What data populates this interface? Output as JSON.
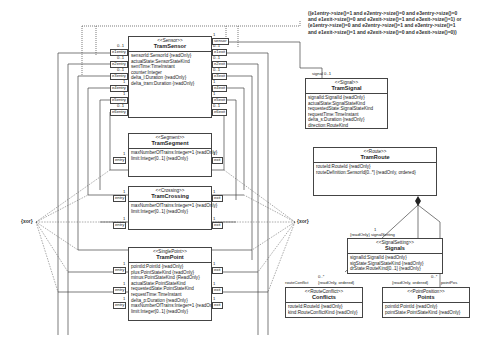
{
  "constraint": {
    "lines": [
      "((e1entry->size()=1 and e2entry->size()=0 and e3entry->size()=0",
      "and e1exit->size()=0 and e2exit->size()=1 and e3exit->size()=1) or",
      "(e1entry->size()=0 and e2entry->size()=1 and e3entry->size()=1",
      "and e1exit->size()=1 and e2exit->size()=0 and e3exit->size()=0))"
    ]
  },
  "xor": {
    "left": "{xor}",
    "right": "{xor}"
  },
  "classes": {
    "tram_sensor": {
      "stereotype": "<<Sensor>>",
      "name": "TramSensor",
      "attributes": [
        "sensorId:SensorId {readOnly}",
        "actualState:SensorStateKind",
        "sentTime:TimeInstant",
        "counter:Integer",
        "delta_l:Duration {readOnly}",
        "delta_tram:Duration {readOnly}"
      ],
      "left_ports": [
        {
          "mult": "0..1",
          "role": "e1entry"
        },
        {
          "mult": "0..1",
          "role": "e2entry"
        },
        {
          "mult": "0..1",
          "role": "e3entry"
        },
        {
          "mult": "1",
          "role": "e4entry"
        },
        {
          "mult": "1",
          "role": "e5entry"
        },
        {
          "mult": "0..1",
          "role": "e6entry"
        }
      ],
      "right_ports": [
        {
          "mult": "1",
          "role": "sensor"
        },
        {
          "mult": "0..1",
          "role": "e1exit"
        },
        {
          "mult": "0..1",
          "role": "e2exit"
        },
        {
          "mult": "0..1",
          "role": "e3exit"
        },
        {
          "mult": "1",
          "role": "e4exit"
        },
        {
          "mult": "1",
          "role": "e5exit"
        },
        {
          "mult": "0..1",
          "role": "e6exit"
        }
      ]
    },
    "tram_signal": {
      "role_label": "signal 0..1",
      "stereotype": "<<Signal>>",
      "name": "TramSignal",
      "attributes": [
        "signalId:SignalId {readOnly}",
        "actualState:SignalStateKind",
        "requestedState:SignalStateKind",
        "requestTime:TimeInstant",
        "delta_s:Duration {readOnly}",
        "direction:RouteKind"
      ]
    },
    "tram_segment": {
      "stereotype": "<<Segment>>",
      "name": "TramSegment",
      "attributes": [
        "maxNumberOfTrains:Integer=1 {readOnly}",
        "limit:Integer[0..1] {readOnly}"
      ],
      "entry": {
        "mult": "1",
        "role": "entry"
      },
      "exit": {
        "mult": "1",
        "role": "exit"
      }
    },
    "tram_crossing": {
      "stereotype": "<<Crossing>>",
      "name": "TramCrossing",
      "attributes": [
        "maxNumberOfTrains:Integer=1 {readOnly}",
        "limit:Integer[0..1] {readOnly}"
      ],
      "entries": [
        {
          "mult": "1",
          "role": "entry"
        },
        {
          "mult": "1",
          "role": "entry"
        }
      ],
      "exits": [
        {
          "mult": "1",
          "role": "exit"
        },
        {
          "mult": "1",
          "role": "exit"
        }
      ]
    },
    "tram_point": {
      "stereotype": "<<SinglePoint>>",
      "name": "TramPoint",
      "attributes": [
        "pointId:PointId {readOnly}",
        "plus:PointStateKind {readOnly}",
        "minus:PointStateKind {ReadOnly}",
        "actualState:PointStateKind",
        "requestedState:PointStateKind",
        "requestTime:TimeInstant",
        "delta_p:Duration {readOnly}",
        "maxNumberOfTrains:Integer=1 {readOnly}",
        "limit:Integer[0..1] {readOnly}"
      ],
      "entries": [
        {
          "mult": "1",
          "role": "entry"
        },
        {
          "mult": "1",
          "role": "entry"
        },
        {
          "mult": "1",
          "role": "entry"
        }
      ],
      "exits": [
        {
          "mult": "1",
          "role": "exit"
        },
        {
          "mult": "1",
          "role": "exit"
        },
        {
          "mult": "1",
          "role": "exit"
        }
      ]
    },
    "tram_route": {
      "stereotype": "<<Route>>",
      "name": "TramRoute",
      "attributes": [
        "routeId:RouteId {readOnly}",
        "routeDefinition:SensorId[0..*] {readOnly, ordered}"
      ]
    },
    "signals": {
      "role_label": "{readOnly} signalSetting",
      "mult": "1",
      "stereotype": "<<SignalSetting>>",
      "name": "Signals",
      "attributes": [
        "signalId:SignalId {readOnly}",
        "sigState:SignalStateKind {readOnly}",
        "drState:RouteKind[0..1] {readOnly}"
      ]
    },
    "conflicts": {
      "role_label": "routeConflict",
      "props": "{readOnly, ordered}",
      "mult": "0..*",
      "stereotype": "<<RouteConflict>>",
      "name": "Conflicts",
      "attributes": [
        "routeId:RouteId {readOnly}",
        "kind:RouteConflictKind {readOnly}"
      ]
    },
    "points": {
      "role_label": "pointPos",
      "props": "{readOnly, ordered}",
      "mult": "0..*",
      "stereotype": "<<PointPosition>>",
      "name": "Points",
      "attributes": [
        "pointId:PointId {readOnly}",
        "pointState:PointStateKind {readOnly}"
      ]
    }
  },
  "colors": {
    "line": "#444444",
    "dashed": "#555555",
    "text": "#222222",
    "background": "#ffffff"
  }
}
